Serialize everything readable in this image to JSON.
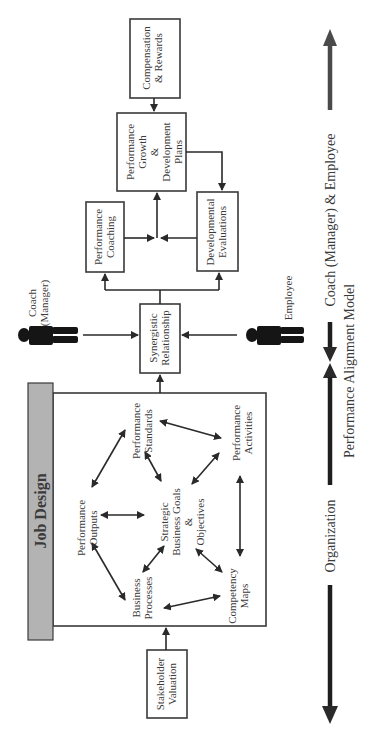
{
  "diagram": {
    "caption": "Performance Alignment Model",
    "orientation": "rotated 90 degrees counterclockwise",
    "axis": {
      "left_label": "Organization",
      "right_label": "Coach (Manager) & Employee",
      "colors": {
        "organization_arrow": "#1e1e1e",
        "coach_employee_arrow": "#4a4a4a"
      }
    },
    "actors": {
      "coach": {
        "line1": "Coach",
        "line2": "(Manager)"
      },
      "employee": {
        "line1": "Employee"
      }
    },
    "job_design": {
      "title": "Job Design",
      "title_bar_color": "#b3b3b3",
      "nodes": {
        "center": {
          "line1": "Strategic",
          "line2": "Business Goals",
          "line3": "&",
          "line4": "Objectives"
        },
        "performance_outputs": {
          "line1": "Performance",
          "line2": "Outputs"
        },
        "performance_standards": {
          "line1": "Performance",
          "line2": "Standards"
        },
        "performance_activities": {
          "line1": "Performance",
          "line2": "Activities"
        },
        "competency_maps": {
          "line1": "Competency",
          "line2": "Maps"
        },
        "business_processes": {
          "line1": "Business",
          "line2": "Processes"
        }
      }
    },
    "boxes": {
      "stakeholder_valuation": {
        "line1": "Stakeholder",
        "line2": "Valuation"
      },
      "synergistic_relationship": {
        "line1": "Synergistic",
        "line2": "Relationship"
      },
      "performance_coaching": {
        "line1": "Performance",
        "line2": "Coaching"
      },
      "developmental_evaluations": {
        "line1": "Developmental",
        "line2": "Evaluations"
      },
      "growth_plans": {
        "line1": "Performance",
        "line2": "Growth",
        "line3": "&",
        "line4": "Development",
        "line5": "Plans"
      },
      "compensation_rewards": {
        "line1": "Compensation",
        "line2": "& Rewards"
      }
    }
  }
}
